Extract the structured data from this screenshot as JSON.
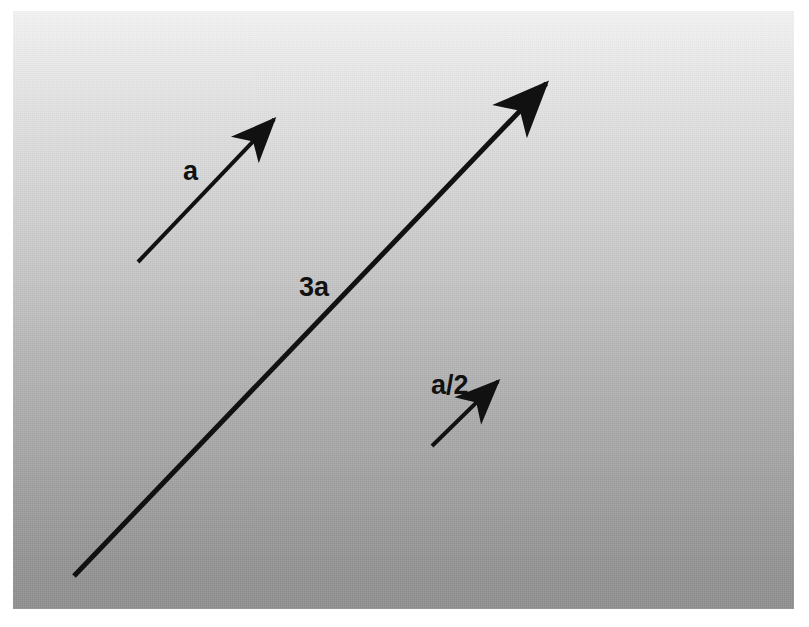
{
  "figure": {
    "background": {
      "panel_color_top": "#f2f2f2",
      "panel_color_bottom": "#8c8c8c",
      "margin_color": "#ffffff"
    },
    "stroke_color": "#111111",
    "labels": {
      "a": "a",
      "three_a": "3a",
      "a_over_2": "a/2"
    },
    "vectors": [
      {
        "name": "vector-a",
        "label": "a",
        "x1": 138,
        "y1": 262,
        "x2": 305,
        "y2": 87,
        "stroke_width": 4
      },
      {
        "name": "vector-3a",
        "label": "3a",
        "x1": 74,
        "y1": 576,
        "x2": 585,
        "y2": 43,
        "stroke_width": 5
      },
      {
        "name": "vector-a-over-2",
        "label": "a/2",
        "x1": 432,
        "y1": 446,
        "x2": 530,
        "y2": 350,
        "stroke_width": 4
      }
    ]
  }
}
